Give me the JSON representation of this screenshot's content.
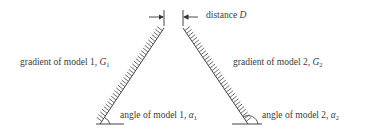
{
  "diagram": {
    "labels": {
      "distance": {
        "text": "distance ",
        "var": "D"
      },
      "gradient1": {
        "text": "gradient of model 1, ",
        "var": "G",
        "sub": "1"
      },
      "gradient2": {
        "text": "gradient of model 2, ",
        "var": "G",
        "sub": "2"
      },
      "angle1": {
        "text": "angle of model 1, ",
        "var": "α",
        "sub": "1"
      },
      "angle2": {
        "text": "angle of model 2, ",
        "var": "α",
        "sub": "2"
      }
    },
    "models": [
      {
        "name": "model 1",
        "top": [
          164,
          28
        ],
        "bottom": [
          100,
          124
        ]
      },
      {
        "name": "model 2",
        "top": [
          183,
          28
        ],
        "bottom": [
          248,
          124
        ]
      }
    ],
    "colors": {
      "line": "#444444",
      "text": "#3a3a3a"
    }
  }
}
